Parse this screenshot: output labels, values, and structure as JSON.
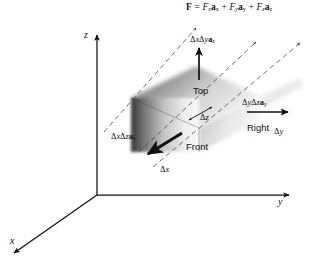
{
  "figure": {
    "type": "vector-calculus-differential-volume-element",
    "background_color": "#ffffff",
    "ink_color": "#111111",
    "formula": {
      "lhs": "F",
      "equals": "=",
      "terms": [
        {
          "scalar": "F",
          "scalar_sub": "x",
          "unit": "a",
          "unit_sub": "x"
        },
        {
          "scalar": "F",
          "scalar_sub": "y",
          "unit": "a",
          "unit_sub": "y"
        },
        {
          "scalar": "F",
          "scalar_sub": "z",
          "unit": "a",
          "unit_sub": "z"
        }
      ],
      "plus": "+"
    },
    "axes": [
      {
        "name": "z-axis",
        "label": "z",
        "direction": "up"
      },
      {
        "name": "y-axis",
        "label": "y",
        "direction": "right"
      },
      {
        "name": "x-axis",
        "label": "x",
        "direction": "down-left"
      }
    ],
    "flux_vectors": [
      {
        "name": "top-flux",
        "face": "Top",
        "d1": "x",
        "d2": "y",
        "unit_sub": "z",
        "arrow": "up",
        "text": "ΔxΔya"
      },
      {
        "name": "right-flux",
        "face": "Right",
        "d1": "y",
        "d2": "z",
        "unit_sub": "y",
        "arrow": "right",
        "text": "ΔyΔza"
      },
      {
        "name": "left-flux",
        "face": "Front",
        "d1": "x",
        "d2": "z",
        "unit_sub": "x",
        "arrow": "down-left",
        "text": "ΔxΔza"
      }
    ],
    "face_labels": [
      {
        "name": "top-face-label",
        "text": "Top"
      },
      {
        "name": "right-face-label",
        "text": "Right"
      },
      {
        "name": "front-face-label",
        "text": "Front"
      }
    ],
    "dimension_labels": [
      {
        "name": "delta-z-label",
        "delta": "Δ",
        "axis": "z"
      },
      {
        "name": "delta-x-label",
        "delta": "Δ",
        "axis": "x"
      },
      {
        "name": "delta-y-label",
        "delta": "Δ",
        "axis": "y"
      }
    ],
    "delta": "Δ",
    "glyphs": {
      "delta": "Δ",
      "equals": "=",
      "plus": "+"
    },
    "labels": {
      "z": "z",
      "y": "y",
      "x": "x",
      "top": "Top",
      "right": "Right",
      "front": "Front",
      "F": "F",
      "Fx": "F",
      "Fy": "F",
      "Fz": "F",
      "ax": "a",
      "ay": "a",
      "az": "a",
      "sub_x": "x",
      "sub_y": "y",
      "sub_z": "z"
    }
  }
}
